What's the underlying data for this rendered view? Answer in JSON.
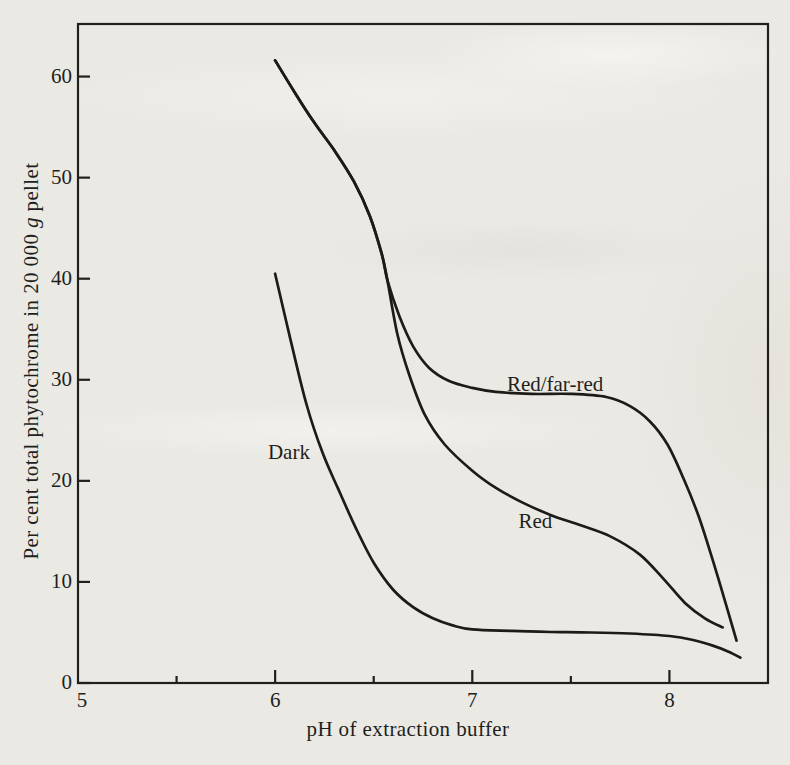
{
  "page": {
    "background_color": "#ebe9e4",
    "ink_color": "#1d1b18"
  },
  "chart_data": {
    "type": "line",
    "title": "",
    "xlabel": "pH of extraction buffer",
    "ylabel": {
      "full": "Per cent total phytochrome in 20 000 g pellet",
      "prefix": "Per cent total phytochrome in 20 000 ",
      "italic": "g",
      "suffix": " pellet"
    },
    "xlim": [
      5,
      8.5
    ],
    "ylim": [
      0,
      65.2
    ],
    "grid": false,
    "legend_position": "inline curve labels",
    "x_ticks": [
      {
        "value": 5.0,
        "label": "5",
        "mark": "none"
      },
      {
        "value": 5.5,
        "label": "",
        "mark": "minor"
      },
      {
        "value": 6.0,
        "label": "6",
        "mark": "major"
      },
      {
        "value": 6.5,
        "label": "",
        "mark": "minor"
      },
      {
        "value": 7.0,
        "label": "7",
        "mark": "major"
      },
      {
        "value": 7.5,
        "label": "",
        "mark": "minor"
      },
      {
        "value": 8.0,
        "label": "8",
        "mark": "major"
      }
    ],
    "y_ticks": [
      {
        "value": 0,
        "label": "0"
      },
      {
        "value": 10,
        "label": "10"
      },
      {
        "value": 20,
        "label": "20"
      },
      {
        "value": 30,
        "label": "30"
      },
      {
        "value": 40,
        "label": "40"
      },
      {
        "value": 50,
        "label": "50"
      },
      {
        "value": 60,
        "label": "60"
      }
    ],
    "series": [
      {
        "name": "Dark",
        "label": "Dark",
        "label_at": {
          "x": 6.07,
          "y": 22.9
        },
        "points": [
          [
            6.0,
            40.5
          ],
          [
            6.08,
            33.8
          ],
          [
            6.16,
            27.5
          ],
          [
            6.24,
            22.8
          ],
          [
            6.32,
            19.2
          ],
          [
            6.41,
            15.3
          ],
          [
            6.5,
            11.9
          ],
          [
            6.6,
            9.2
          ],
          [
            6.7,
            7.5
          ],
          [
            6.8,
            6.4
          ],
          [
            6.9,
            5.7
          ],
          [
            7.0,
            5.3
          ],
          [
            7.2,
            5.15
          ],
          [
            7.4,
            5.05
          ],
          [
            7.6,
            5.0
          ],
          [
            7.8,
            4.9
          ],
          [
            8.0,
            4.65
          ],
          [
            8.12,
            4.25
          ],
          [
            8.22,
            3.7
          ],
          [
            8.3,
            3.1
          ],
          [
            8.36,
            2.5
          ]
        ]
      },
      {
        "name": "Red",
        "label": "Red",
        "label_at": {
          "x": 7.32,
          "y": 16.0
        },
        "points": [
          [
            6.0,
            61.6
          ],
          [
            6.1,
            58.4
          ],
          [
            6.2,
            55.4
          ],
          [
            6.3,
            52.7
          ],
          [
            6.4,
            49.6
          ],
          [
            6.48,
            46.2
          ],
          [
            6.54,
            42.5
          ],
          [
            6.57,
            39.8
          ],
          [
            6.62,
            34.5
          ],
          [
            6.68,
            30.5
          ],
          [
            6.76,
            26.5
          ],
          [
            6.86,
            23.6
          ],
          [
            7.0,
            21.0
          ],
          [
            7.12,
            19.3
          ],
          [
            7.25,
            17.9
          ],
          [
            7.4,
            16.6
          ],
          [
            7.55,
            15.6
          ],
          [
            7.7,
            14.5
          ],
          [
            7.85,
            12.7
          ],
          [
            7.97,
            10.3
          ],
          [
            8.08,
            7.9
          ],
          [
            8.18,
            6.4
          ],
          [
            8.27,
            5.5
          ]
        ]
      },
      {
        "name": "Red/far-red",
        "label": "Red/far-red",
        "label_at": {
          "x": 7.42,
          "y": 29.6
        },
        "points": [
          [
            6.0,
            61.6
          ],
          [
            6.1,
            58.4
          ],
          [
            6.2,
            55.4
          ],
          [
            6.3,
            52.7
          ],
          [
            6.4,
            49.6
          ],
          [
            6.48,
            46.2
          ],
          [
            6.54,
            42.5
          ],
          [
            6.57,
            39.8
          ],
          [
            6.63,
            36.3
          ],
          [
            6.7,
            33.3
          ],
          [
            6.78,
            31.2
          ],
          [
            6.88,
            29.9
          ],
          [
            7.0,
            29.2
          ],
          [
            7.12,
            28.8
          ],
          [
            7.3,
            28.6
          ],
          [
            7.5,
            28.6
          ],
          [
            7.68,
            28.3
          ],
          [
            7.8,
            27.4
          ],
          [
            7.9,
            25.9
          ],
          [
            7.99,
            23.6
          ],
          [
            8.07,
            20.3
          ],
          [
            8.15,
            16.4
          ],
          [
            8.23,
            11.5
          ],
          [
            8.3,
            6.9
          ],
          [
            8.34,
            4.2
          ]
        ]
      }
    ]
  }
}
